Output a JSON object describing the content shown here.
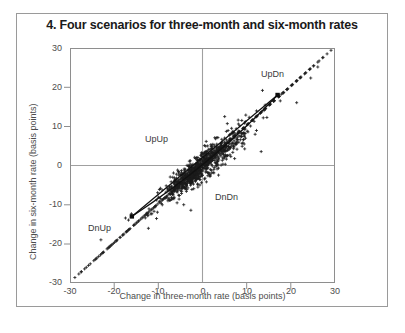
{
  "figure": {
    "number": "4.",
    "title": "4. Four scenarios for three-month and six-month rates"
  },
  "axes": {
    "xlabel": "Change in three-month rate (basis points)",
    "ylabel": "Change in six-month rate (basis points)",
    "xticks": [
      "-30",
      "-20",
      "-10",
      "0",
      "10",
      "20",
      "30"
    ],
    "yticks": [
      "30",
      "20",
      "10",
      "0",
      "-10",
      "-20",
      "-30"
    ]
  },
  "annotations": {
    "upup": "UpUp",
    "updn": "UpDn",
    "dnup": "DnUp",
    "dndn": "DnDn"
  },
  "colors": {
    "marker": "#1c1c1c",
    "frame": "#8e8e8e",
    "zero_line": "#a0a0a0",
    "text": "#4d4d4d",
    "title": "#1a1a1a",
    "border": "#9a9a9a"
  },
  "chart_data": {
    "type": "scatter",
    "title": "4. Four scenarios for three-month and six-month rates",
    "xlabel": "Change in three-month rate (basis points)",
    "ylabel": "Change in six-month rate (basis points)",
    "xlim": [
      -30,
      30
    ],
    "ylim": [
      -30,
      30
    ],
    "xticks": [
      -30,
      -20,
      -10,
      0,
      10,
      20,
      30
    ],
    "yticks": [
      -30,
      -20,
      -10,
      0,
      10,
      20,
      30
    ],
    "grid": false,
    "legend": null,
    "marker": "plus",
    "n_points": 1100,
    "point_cloud_description": "Dense elongated cloud along the 45-degree diagonal centred on the origin; correlation approximately 0.9, most mass within +/-10 basis points on both axes, with sparse outliers out to +/-29.",
    "quadrant_labels": [
      {
        "text": "UpUp",
        "x": -7.5,
        "y": 4.5
      },
      {
        "text": "UpDn",
        "x": 16.0,
        "y": 20.5
      },
      {
        "text": "DnUp",
        "x": -20.0,
        "y": -19.0
      },
      {
        "text": "DnDn",
        "x": 4.5,
        "y": -8.5
      }
    ],
    "lines": [
      {
        "name": "upper-ray",
        "points": [
          [
            -16.0,
            -13.0
          ],
          [
            17.0,
            18.0
          ]
        ]
      },
      {
        "name": "lower-ray",
        "points": [
          [
            -16.0,
            -13.0
          ],
          [
            17.0,
            18.0
          ]
        ],
        "bow": "below"
      }
    ],
    "endpoints": [
      {
        "name": "lower-left-vertex",
        "x": -16.0,
        "y": -13.0,
        "marker": "filled-square"
      },
      {
        "name": "upper-right-vertex",
        "x": 17.0,
        "y": 18.0,
        "marker": "filled-square"
      }
    ],
    "series": [
      {
        "name": "daily changes",
        "x": [
          0.3,
          -1.2,
          2.1,
          -0.5,
          1.8,
          -2.4,
          0.9,
          3.2,
          -3.1,
          1.4,
          -0.8,
          2.7,
          -1.9,
          0.6,
          4.1,
          -4.3,
          2.2,
          -2.8,
          1.1,
          -0.3,
          5.2,
          -5.6,
          3.4,
          -3.7,
          0.2,
          1.6,
          -1.5,
          2.9,
          -2.2,
          6.1,
          -6.4,
          4.2,
          -4.6,
          0.8,
          -0.9,
          3.8,
          -3.3,
          1.3,
          -1.1,
          7.3,
          -7.1,
          5.4,
          -5.2,
          2.5,
          -2.6,
          0.4,
          -0.6,
          8.2,
          -8.5,
          6.3,
          -6.0,
          3.1,
          -3.6,
          1.9,
          -1.7,
          9.1,
          -9.4,
          7.2,
          -7.6,
          4.4,
          -4.0,
          2.0,
          -2.3,
          10.3,
          -10.1,
          8.4,
          -8.2,
          5.1,
          -5.5,
          3.0,
          -3.4,
          11.2,
          -11.6,
          9.3,
          -9.0,
          6.2,
          -6.6,
          4.3,
          -4.7,
          12.4,
          -12.2,
          10.2,
          -10.5,
          7.4,
          -7.0,
          5.3,
          -5.8,
          13.1,
          -13.5,
          11.4,
          -11.1,
          8.1,
          -8.6,
          6.4,
          -6.2,
          14.3,
          -14.0,
          12.1,
          -12.6,
          9.2,
          -9.7,
          7.1,
          -7.5,
          15.2,
          -15.6,
          13.3,
          -13.2,
          10.4,
          -10.8,
          8.3,
          -8.0,
          16.1,
          -16.4,
          14.2,
          -14.5,
          11.3,
          -11.9,
          9.4,
          -9.1,
          17.4,
          -17.2,
          15.1,
          -15.3,
          12.2,
          -12.8,
          10.1,
          -10.6,
          18.3,
          -18.1,
          16.2,
          -16.7,
          13.4,
          -13.0,
          11.2,
          -11.4,
          19.2,
          -19.5,
          17.3,
          -17.1,
          14.1,
          -14.4,
          12.3,
          -12.5,
          20.4,
          -20.2,
          18.2,
          -18.6,
          15.4,
          -15.0,
          13.1,
          -13.7,
          21.3,
          -21.6,
          19.1,
          -19.3,
          16.3,
          -16.9,
          14.2,
          -14.8,
          22.2,
          -22.5,
          20.3,
          -20.7,
          17.2,
          -17.8,
          15.3,
          -15.5,
          23.4,
          -23.1,
          21.2,
          -21.4,
          18.4,
          -18.0,
          16.1,
          -16.6,
          24.3,
          -24.6,
          22.1,
          -22.8,
          19.3,
          -19.9,
          17.4,
          -17.3,
          25.2,
          -25.4,
          23.3,
          -23.5,
          20.1,
          -20.9,
          18.2,
          -18.7,
          26.1,
          -26.3,
          24.2,
          -24.1,
          21.4,
          -21.2,
          19.1,
          -19.6,
          27.3,
          -27.5,
          25.1,
          -25.8,
          22.3,
          -22.4,
          20.2,
          -20.5,
          28.2,
          -28.0,
          26.4,
          -26.7,
          23.1,
          -23.9,
          21.3,
          -21.1,
          29.1,
          -28.9,
          27.2,
          -27.4,
          24.4,
          -24.3,
          22.1,
          -22.6
        ],
        "y": [
          0.5,
          -1.0,
          2.4,
          -0.2,
          2.1,
          -2.1,
          1.2,
          3.5,
          -2.8,
          1.7,
          -0.5,
          3.0,
          -1.6,
          0.9,
          4.4,
          -4.0,
          2.5,
          -2.5,
          1.4,
          0.0,
          5.5,
          -5.3,
          3.7,
          -3.4,
          0.5,
          1.9,
          -1.2,
          3.2,
          -1.9,
          6.4,
          -6.1,
          4.5,
          -4.3,
          1.1,
          -0.6,
          4.1,
          -3.0,
          1.6,
          -0.8,
          7.6,
          -6.8,
          5.7,
          -4.9,
          2.8,
          -2.3,
          0.7,
          -0.3,
          8.5,
          -8.2,
          6.6,
          -5.7,
          3.4,
          -3.3,
          2.2,
          -1.4,
          9.4,
          -9.1,
          7.5,
          -7.3,
          4.7,
          -3.7,
          2.3,
          -2.0,
          10.6,
          -9.8,
          8.7,
          -7.9,
          5.4,
          -5.2,
          3.3,
          -3.1,
          11.5,
          -11.3,
          9.6,
          -8.7,
          6.5,
          -6.3,
          4.6,
          -4.4,
          12.7,
          -11.9,
          10.5,
          -10.2,
          7.7,
          -6.7,
          5.6,
          -5.5,
          13.4,
          -13.2,
          11.7,
          -10.8,
          8.4,
          -8.3,
          6.7,
          -5.9,
          14.6,
          -13.7,
          12.4,
          -12.3,
          9.5,
          -9.4,
          7.4,
          -7.2,
          15.5,
          -15.3,
          13.6,
          -12.9,
          10.7,
          -10.5,
          8.6,
          -7.7,
          16.4,
          -16.1,
          14.5,
          -14.2,
          11.6,
          -11.6,
          9.7,
          -8.8,
          17.7,
          -16.9,
          15.4,
          -15.0,
          12.5,
          -12.5,
          10.4,
          -10.3,
          18.6,
          -17.8,
          16.5,
          -16.4,
          13.7,
          -12.7,
          11.5,
          -11.1,
          19.5,
          -19.2,
          17.6,
          -16.8,
          14.4,
          -14.1,
          12.6,
          -12.2,
          20.7,
          -19.9,
          18.5,
          -18.3,
          15.7,
          -14.7,
          13.4,
          -13.4,
          21.6,
          -21.3,
          19.4,
          -19.0,
          16.6,
          -16.6,
          14.5,
          -14.5,
          22.5,
          -22.2,
          20.6,
          -20.4,
          17.5,
          -17.5,
          15.6,
          -15.2,
          23.7,
          -22.8,
          21.5,
          -21.1,
          18.7,
          -17.7,
          16.4,
          -16.3,
          24.6,
          -24.3,
          22.4,
          -22.5,
          19.6,
          -19.6,
          17.7,
          -17.0,
          25.5,
          -25.1,
          23.6,
          -23.2,
          20.4,
          -20.6,
          18.5,
          -18.4,
          26.4,
          -26.0,
          24.5,
          -23.8,
          21.7,
          -20.9,
          19.4,
          -19.3,
          27.6,
          -27.2,
          25.4,
          -25.5,
          22.6,
          -22.1,
          20.5,
          -20.2,
          28.5,
          -27.7,
          26.7,
          -26.4,
          23.4,
          -23.6,
          21.6,
          -20.8,
          29.4,
          -28.6,
          27.5,
          -27.1,
          24.7,
          -24.0,
          22.4,
          -22.3
        ]
      }
    ]
  }
}
